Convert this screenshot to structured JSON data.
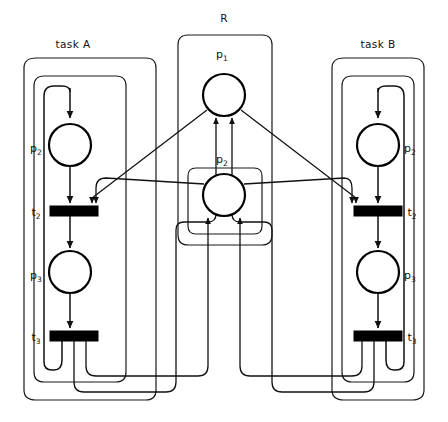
{
  "diagram": {
    "type": "petri-net",
    "width": 448,
    "height": 422,
    "background_color": "#ffffff",
    "stroke_color": "#111111",
    "place_fill": "#ffffff",
    "transition_fill": "#000000"
  },
  "groups": [
    {
      "id": "task-a",
      "label": "task A",
      "label_x": 73,
      "label_y": 48
    },
    {
      "id": "resource",
      "label": "R",
      "label_x": 222,
      "label_y": 22
    },
    {
      "id": "task-b",
      "label": "task B",
      "label_x": 376,
      "label_y": 48
    }
  ],
  "places": [
    {
      "id": "a-p2",
      "label": "p",
      "sub": "2",
      "cx": 70,
      "cy": 145,
      "r": 21,
      "label_x": 36,
      "label_y": 152
    },
    {
      "id": "a-p3",
      "label": "p",
      "sub": "3",
      "cx": 70,
      "cy": 272,
      "r": 21,
      "label_x": 36,
      "label_y": 279
    },
    {
      "id": "r-p1",
      "label": "p",
      "sub": "1",
      "cx": 224,
      "cy": 95,
      "r": 21,
      "label_x": 218,
      "label_y": 58
    },
    {
      "id": "r-p2",
      "label": "p",
      "sub": "2",
      "cx": 224,
      "cy": 195,
      "r": 21,
      "label_x": 218,
      "label_y": 163
    },
    {
      "id": "b-p2",
      "label": "p",
      "sub": "2",
      "cx": 378,
      "cy": 145,
      "r": 21,
      "label_x": 406,
      "label_y": 152
    },
    {
      "id": "b-p3",
      "label": "p",
      "sub": "3",
      "cx": 378,
      "cy": 272,
      "r": 21,
      "label_x": 406,
      "label_y": 279
    }
  ],
  "transitions": [
    {
      "id": "a-t2",
      "label": "t",
      "sub": "2",
      "x": 50,
      "y": 206,
      "w": 48,
      "h": 10,
      "label_x": 33,
      "label_y": 216
    },
    {
      "id": "a-t3",
      "label": "t",
      "sub": "3",
      "x": 50,
      "y": 331,
      "w": 48,
      "h": 10,
      "label_x": 33,
      "label_y": 341
    },
    {
      "id": "b-t2",
      "label": "t",
      "sub": "2",
      "x": 354,
      "y": 206,
      "w": 48,
      "h": 10,
      "label_x": 408,
      "label_y": 216
    },
    {
      "id": "b-t3",
      "label": "t",
      "sub": "3",
      "x": 354,
      "y": 331,
      "w": 48,
      "h": 10,
      "label_x": 408,
      "label_y": 341
    }
  ],
  "arcs_description": [
    "a-p2 -> a-t2",
    "a-t2 -> a-p3",
    "a-p3 -> a-t3",
    "a-t3 -> a-p2 (feedback loop left)",
    "b-p2 -> b-t2",
    "b-t2 -> b-p3",
    "b-p3 -> b-t3",
    "b-t3 -> b-p2 (feedback loop right)",
    "r-p1 -> a-t2 (diagonal)",
    "r-p1 -> b-t2 (diagonal)",
    "r-p2 -> a-t2 (diagonal)",
    "r-p2 -> b-t2 (diagonal)",
    "a-t3 -> r-p1",
    "b-t3 -> r-p1",
    "a-t3 -> r-p2",
    "b-t3 -> r-p2"
  ]
}
